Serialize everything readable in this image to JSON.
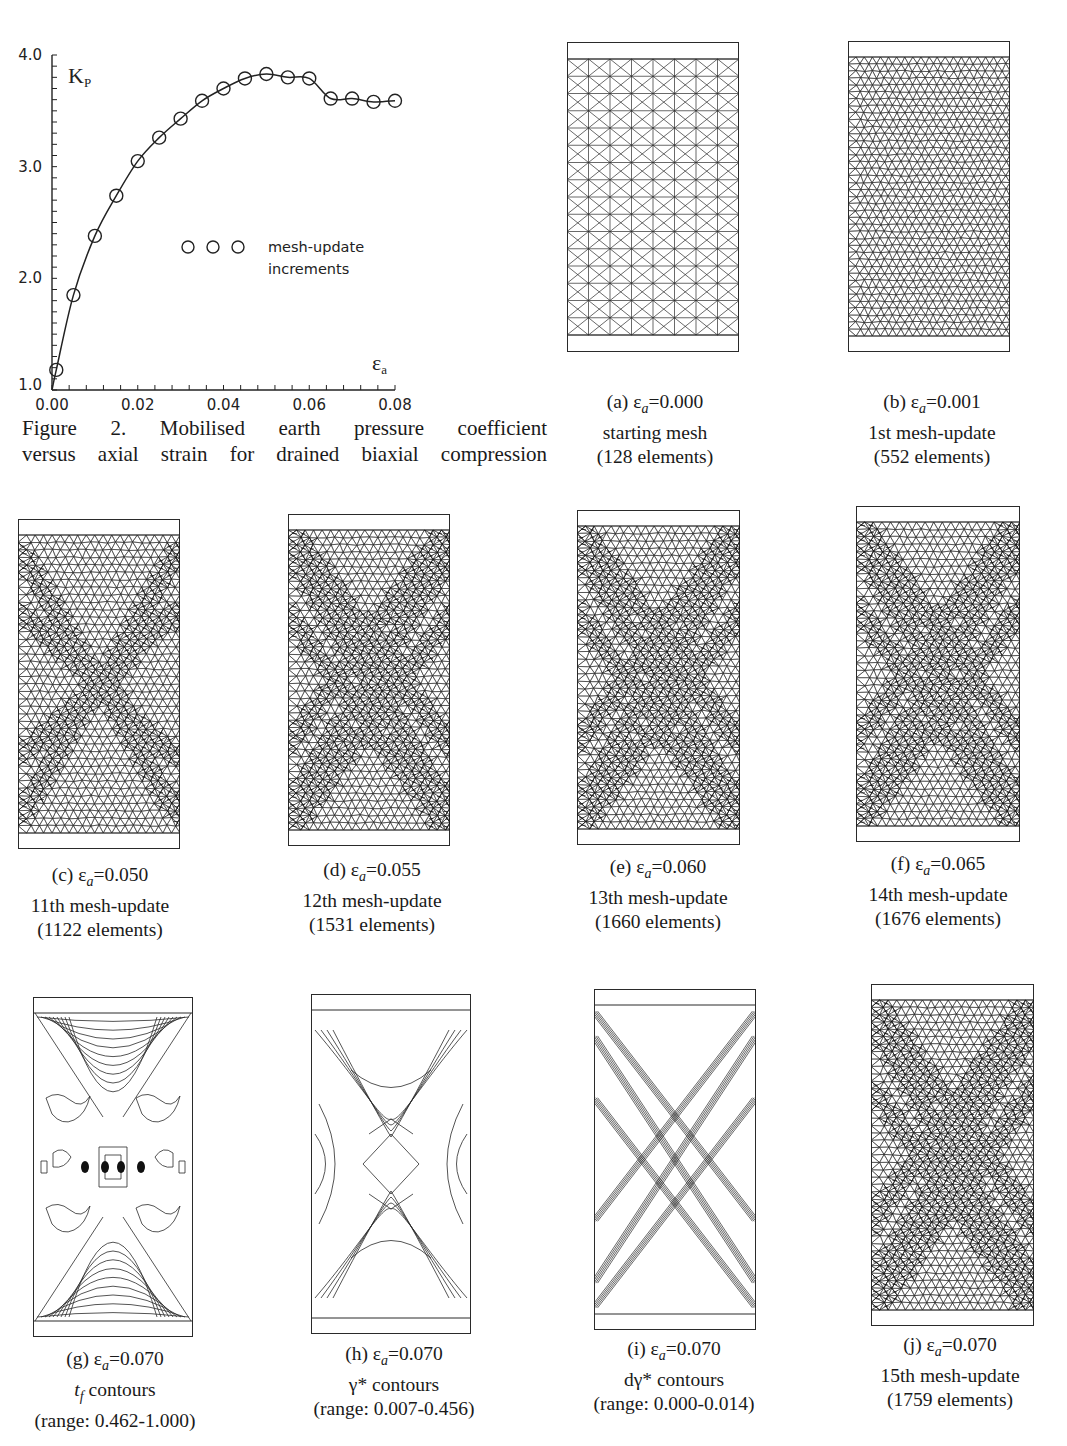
{
  "chart_data": {
    "type": "line",
    "title": "",
    "xlabel": "ε_a",
    "ylabel": "K_P",
    "x_ticks": [
      "0.00",
      "0.02",
      "0.04",
      "0.06",
      "0.08"
    ],
    "y_ticks": [
      "1.0",
      "2.0",
      "3.0",
      "4.0"
    ],
    "xlim": [
      0.0,
      0.08
    ],
    "ylim": [
      1.0,
      4.0
    ],
    "grid": false,
    "series": [
      {
        "name": "mesh-update increments",
        "marker": "open-circle",
        "line": "solid",
        "x": [
          0.001,
          0.005,
          0.01,
          0.015,
          0.02,
          0.025,
          0.03,
          0.035,
          0.04,
          0.045,
          0.05,
          0.055,
          0.06,
          0.065,
          0.07,
          0.075,
          0.08
        ],
        "y": [
          1.18,
          1.85,
          2.38,
          2.74,
          3.05,
          3.26,
          3.43,
          3.59,
          3.7,
          3.79,
          3.83,
          3.8,
          3.79,
          3.61,
          3.61,
          3.58,
          3.59
        ]
      }
    ],
    "legend": {
      "symbol_count": 3,
      "line1": "mesh-update",
      "line2": "increments",
      "position": "center-right"
    }
  },
  "figure_caption": {
    "line1": "Figure 2.  Mobilised earth pressure coefficient",
    "line2": "versus axial strain for drained biaxial compression"
  },
  "panels": [
    {
      "id": "a",
      "prefix": "(a) ε",
      "sub": "a",
      "value": "=0.000",
      "line2": "starting mesh",
      "line3": "(128 elements)",
      "kind": "regular"
    },
    {
      "id": "b",
      "prefix": "(b) ε",
      "sub": "a",
      "value": "=0.001",
      "line2": "1st mesh-update",
      "line3": "(552 elements)",
      "kind": "fine"
    },
    {
      "id": "c",
      "prefix": "(c) ε",
      "sub": "a",
      "value": "=0.050",
      "line2": "11th mesh-update",
      "line3": "(1122 elements)",
      "kind": "mesh-bands"
    },
    {
      "id": "d",
      "prefix": "(d) ε",
      "sub": "a",
      "value": "=0.055",
      "line2": "12th mesh-update",
      "line3": "(1531 elements)",
      "kind": "mesh-bands"
    },
    {
      "id": "e",
      "prefix": "(e) ε",
      "sub": "a",
      "value": "=0.060",
      "line2": "13th mesh-update",
      "line3": "(1660 elements)",
      "kind": "mesh-bands"
    },
    {
      "id": "f",
      "prefix": "(f) ε",
      "sub": "a",
      "value": "=0.065",
      "line2": "14th mesh-update",
      "line3": "(1676 elements)",
      "kind": "mesh-bands"
    },
    {
      "id": "g",
      "prefix": "(g) ε",
      "sub": "a",
      "value": "=0.070",
      "line2_sym": "t",
      "line2_sub": "f",
      "line2": " contours",
      "line3": "(range: 0.462-1.000)",
      "kind": "contour-tf"
    },
    {
      "id": "h",
      "prefix": "(h) ε",
      "sub": "a",
      "value": "=0.070",
      "line2": "γ* contours",
      "line3": "(range: 0.007-0.456)",
      "kind": "contour-gamma"
    },
    {
      "id": "i",
      "prefix": "(i) ε",
      "sub": "a",
      "value": "=0.070",
      "line2": "dγ* contours",
      "line3": "(range: 0.000-0.014)",
      "kind": "contour-dgamma"
    },
    {
      "id": "j",
      "prefix": "(j) ε",
      "sub": "a",
      "value": "=0.070",
      "line2": "15th mesh-update",
      "line3": "(1759 elements)",
      "kind": "mesh-bands"
    }
  ]
}
